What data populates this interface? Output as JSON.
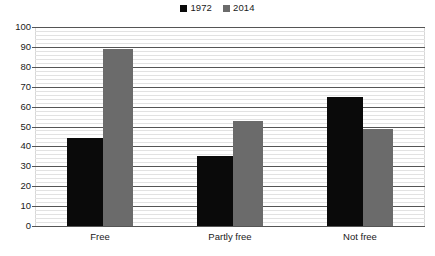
{
  "chart_data": {
    "type": "bar",
    "title": "",
    "subtitle": "",
    "xlabel": "",
    "ylabel": "",
    "categories": [
      "Free",
      "Partly free",
      "Not free"
    ],
    "series": [
      {
        "name": "1972",
        "color": "#0a0a0a",
        "values": [
          44,
          35,
          65
        ]
      },
      {
        "name": "2014",
        "color": "#6b6b6b",
        "values": [
          89,
          53,
          49
        ]
      }
    ],
    "ylim": [
      0,
      100
    ],
    "ytick_step": 10,
    "yticks": [
      0,
      10,
      20,
      30,
      40,
      50,
      60,
      70,
      80,
      90,
      100
    ],
    "ytick_labels": [
      "0",
      "10",
      "20",
      "30",
      "40",
      "50",
      "60",
      "70",
      "80",
      "90",
      "100"
    ],
    "grid": true,
    "minor_grid": true,
    "legend_position": "top-center",
    "annotations": []
  },
  "legend": {
    "entries": [
      {
        "label": "1972",
        "swatch_name": "legend-swatch-1972"
      },
      {
        "label": "2014",
        "swatch_name": "legend-swatch-2014"
      }
    ]
  },
  "colors": {
    "series_1972": "#0a0a0a",
    "series_2014": "#6b6b6b",
    "gridline_major": "#555555",
    "gridline_minor": "#e2e2e2",
    "background": "#ffffff",
    "text": "#1a1a1a"
  }
}
